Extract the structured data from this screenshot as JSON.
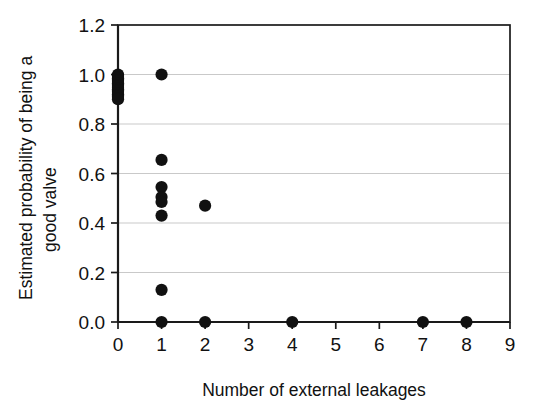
{
  "chart_data": {
    "type": "scatter",
    "title": "",
    "xlabel": "Number of external leakages",
    "ylabel": "Estimated probability of being a good valve",
    "ylabel_line1": "Estimated probability of being a",
    "ylabel_line2": "good valve",
    "xlim": [
      0,
      9
    ],
    "ylim": [
      0.0,
      1.2
    ],
    "xticks": [
      0,
      1,
      2,
      3,
      4,
      5,
      6,
      7,
      8,
      9
    ],
    "xtick_labels": [
      "0",
      "1",
      "2",
      "3",
      "4",
      "5",
      "6",
      "7",
      "8",
      "9"
    ],
    "yticks": [
      0.0,
      0.2,
      0.4,
      0.6,
      0.8,
      1.0,
      1.2
    ],
    "ytick_labels": [
      "0.0",
      "0.2",
      "0.4",
      "0.6",
      "0.8",
      "1.0",
      "1.2"
    ],
    "grid": "horizontal",
    "legend": "none",
    "marker_style": "filled-circle",
    "marker_color": "#111111",
    "marker_size": 9,
    "points": [
      {
        "x": 0,
        "y": 1.0
      },
      {
        "x": 0,
        "y": 0.995
      },
      {
        "x": 0,
        "y": 0.99
      },
      {
        "x": 0,
        "y": 0.985
      },
      {
        "x": 0,
        "y": 0.98
      },
      {
        "x": 0,
        "y": 0.975
      },
      {
        "x": 0,
        "y": 0.97
      },
      {
        "x": 0,
        "y": 0.965
      },
      {
        "x": 0,
        "y": 0.96
      },
      {
        "x": 0,
        "y": 0.955
      },
      {
        "x": 0,
        "y": 0.95
      },
      {
        "x": 0,
        "y": 0.945
      },
      {
        "x": 0,
        "y": 0.94
      },
      {
        "x": 0,
        "y": 0.935
      },
      {
        "x": 0,
        "y": 0.93
      },
      {
        "x": 0,
        "y": 0.925
      },
      {
        "x": 0,
        "y": 0.92
      },
      {
        "x": 0,
        "y": 0.915
      },
      {
        "x": 0,
        "y": 0.91
      },
      {
        "x": 0,
        "y": 0.905
      },
      {
        "x": 0,
        "y": 0.9
      },
      {
        "x": 1,
        "y": 1.0
      },
      {
        "x": 1,
        "y": 0.655
      },
      {
        "x": 1,
        "y": 0.545
      },
      {
        "x": 1,
        "y": 0.505
      },
      {
        "x": 1,
        "y": 0.485
      },
      {
        "x": 1,
        "y": 0.43
      },
      {
        "x": 1,
        "y": 0.13
      },
      {
        "x": 1,
        "y": 0.0
      },
      {
        "x": 2,
        "y": 0.47
      },
      {
        "x": 2,
        "y": 0.0
      },
      {
        "x": 4,
        "y": 0.0
      },
      {
        "x": 7,
        "y": 0.0
      },
      {
        "x": 8,
        "y": 0.0
      }
    ]
  },
  "colors": {
    "background": "#ffffff",
    "axis": "#1a1a1a",
    "grid": "#c9c9c9",
    "marker": "#111111"
  }
}
